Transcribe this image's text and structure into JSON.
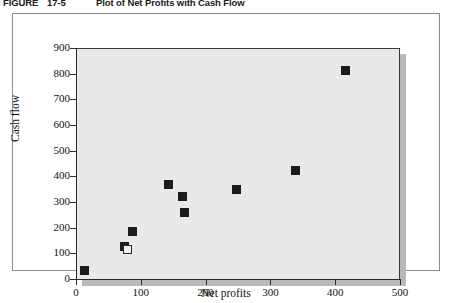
{
  "figure": {
    "label": "FIGURE",
    "number": "17-5",
    "caption": "Plot of Net Profits with Cash Flow"
  },
  "chart_data": {
    "type": "scatter",
    "title": "Plot of Net Profits with Cash Flow",
    "xlabel": "Net profits",
    "ylabel": "Cash flow",
    "xlim": [
      0,
      500
    ],
    "ylim": [
      0,
      900
    ],
    "xticks": [
      0,
      100,
      200,
      300,
      400,
      500
    ],
    "yticks": [
      0,
      100,
      200,
      300,
      400,
      500,
      600,
      700,
      800,
      900
    ],
    "grid": false,
    "legend": null,
    "series": [
      {
        "name": "Companies",
        "marker": "filled-square",
        "points": [
          {
            "x": 13,
            "y": 32,
            "style": "filled"
          },
          {
            "x": 75,
            "y": 128,
            "style": "filled"
          },
          {
            "x": 80,
            "y": 115,
            "style": "hollow"
          },
          {
            "x": 87,
            "y": 186,
            "style": "filled"
          },
          {
            "x": 143,
            "y": 368,
            "style": "filled"
          },
          {
            "x": 165,
            "y": 323,
            "style": "filled"
          },
          {
            "x": 168,
            "y": 261,
            "style": "filled"
          },
          {
            "x": 247,
            "y": 347,
            "style": "filled"
          },
          {
            "x": 338,
            "y": 424,
            "style": "filled"
          },
          {
            "x": 416,
            "y": 812,
            "style": "filled"
          }
        ]
      }
    ]
  },
  "colors": {
    "plot_background": "#e9e9e9",
    "marker": "#1b1b1b",
    "axis": "#2a2a2a",
    "shadow": "#b9b9b9",
    "card_border": "#8a8a8a"
  }
}
